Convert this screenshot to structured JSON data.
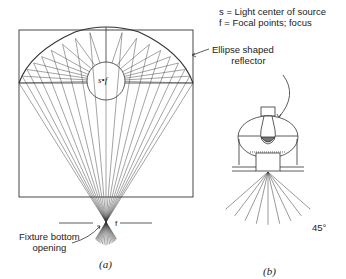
{
  "legend": {
    "s_def": "s = Light center of source",
    "f_def": "f = Focal points; focus"
  },
  "labels": {
    "reflector": [
      "Ellipse shaped",
      "reflector"
    ],
    "fixture_opening": [
      "Fixture bottom",
      "opening"
    ],
    "source_focus": "s•f",
    "focus": "f",
    "angle": "45°"
  },
  "captions": {
    "a": "(a)",
    "b": "(b)"
  },
  "colors": {
    "line": "#333333",
    "background": "#ffffff"
  }
}
